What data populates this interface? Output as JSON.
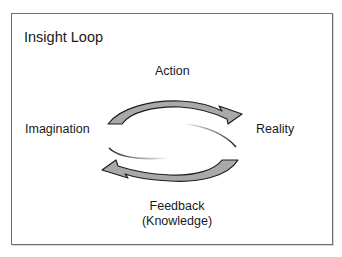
{
  "diagram": {
    "title": "Insight Loop",
    "nodes": {
      "top": "Action",
      "left": "Imagination",
      "right": "Reality",
      "bottom_line1": "Feedback",
      "bottom_line2": "(Knowledge)"
    },
    "edges": [
      {
        "from": "Imagination",
        "to": "Reality",
        "via": "Action",
        "direction": "clockwise-top"
      },
      {
        "from": "Reality",
        "to": "Imagination",
        "via": "Feedback (Knowledge)",
        "direction": "clockwise-bottom"
      }
    ],
    "colors": {
      "border": "#6e6e6e",
      "arrow_fill": "#a9a9a9",
      "arrow_stroke": "#1e1e1e",
      "text": "#1a1a1a"
    }
  }
}
